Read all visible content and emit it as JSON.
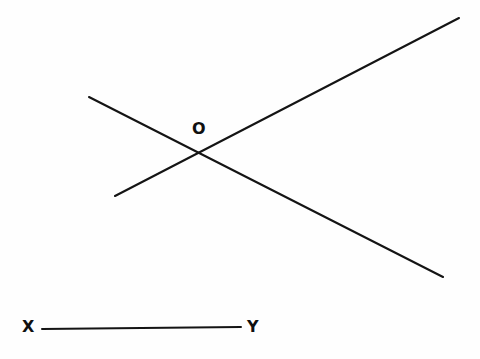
{
  "figure": {
    "background_color": "#fefefe",
    "stroke_color": "#141414",
    "width": 480,
    "height": 359,
    "labels": {
      "intersection": "O",
      "segment_start": "X",
      "segment_end": "Y"
    }
  },
  "chart_data": {
    "type": "scatter",
    "title": "",
    "subtitle": "",
    "xlabel": "",
    "ylabel": "",
    "grid": false,
    "legend": null,
    "xlim": [
      0,
      480
    ],
    "ylim": [
      359,
      0
    ],
    "series": [
      {
        "name": "ascending-line",
        "type": "line",
        "x": [
          115,
          459
        ],
        "y": [
          196,
          18
        ],
        "label": ""
      },
      {
        "name": "descending-line",
        "type": "line",
        "x": [
          89,
          443
        ],
        "y": [
          97,
          277
        ],
        "label": ""
      },
      {
        "name": "segment-xy",
        "type": "line",
        "x": [
          42,
          241
        ],
        "y": [
          329,
          327
        ],
        "label": "XY"
      }
    ],
    "annotations": [
      {
        "text": "O",
        "x": 199,
        "y": 129,
        "bold": true
      },
      {
        "text": "X",
        "x": 28,
        "y": 327,
        "bold": true
      },
      {
        "text": "Y",
        "x": 253,
        "y": 327,
        "bold": true
      }
    ],
    "points": [
      {
        "name": "O",
        "x": 199,
        "y": 152,
        "description": "intersection of the two lines"
      }
    ]
  }
}
